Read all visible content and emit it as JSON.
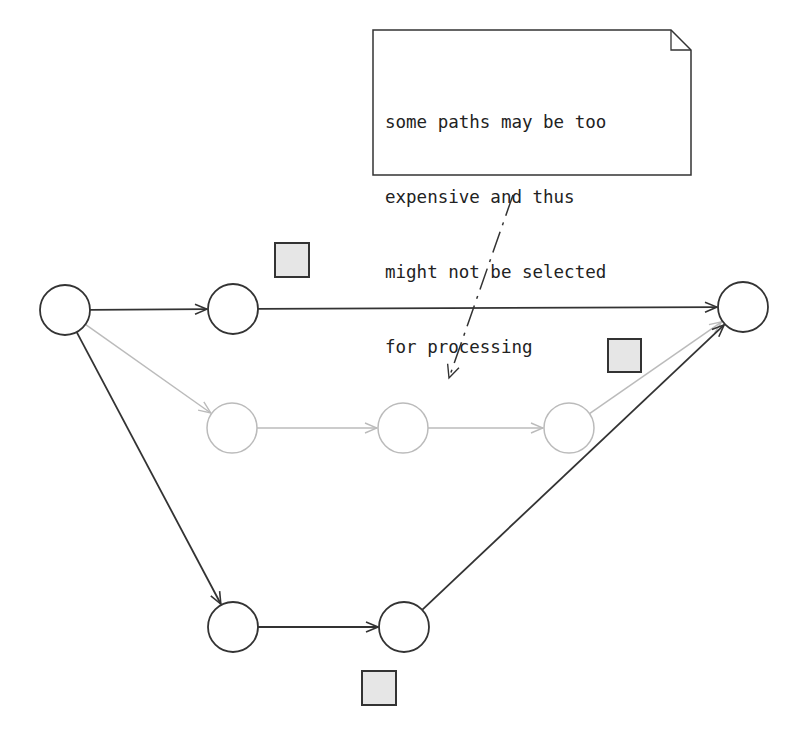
{
  "top_caption_partial": "",
  "note": {
    "lines": [
      "some paths may be too",
      "expensive and thus",
      "might not be selected",
      "for processing"
    ],
    "box": {
      "x": 373,
      "y": 30,
      "w": 318,
      "h": 145,
      "fold": 20
    }
  },
  "colors": {
    "active_stroke": "#333333",
    "inactive_stroke": "#bbbbbb",
    "square_fill": "#e6e6e6",
    "square_stroke": "#333333",
    "background": "#ffffff"
  },
  "nodes": [
    {
      "id": "A",
      "cx": 65,
      "cy": 310,
      "r": 25,
      "state": "active"
    },
    {
      "id": "B",
      "cx": 233,
      "cy": 309,
      "r": 25,
      "state": "active"
    },
    {
      "id": "C",
      "cx": 232,
      "cy": 428,
      "r": 25,
      "state": "inactive"
    },
    {
      "id": "D",
      "cx": 403,
      "cy": 428,
      "r": 25,
      "state": "inactive"
    },
    {
      "id": "E",
      "cx": 569,
      "cy": 428,
      "r": 25,
      "state": "inactive"
    },
    {
      "id": "F",
      "cx": 743,
      "cy": 307,
      "r": 25,
      "state": "active"
    },
    {
      "id": "G",
      "cx": 233,
      "cy": 627,
      "r": 25,
      "state": "active"
    },
    {
      "id": "H",
      "cx": 404,
      "cy": 627,
      "r": 25,
      "state": "active"
    }
  ],
  "edges": [
    {
      "from": "A",
      "to": "B",
      "state": "active"
    },
    {
      "from": "B",
      "to": "F",
      "state": "active"
    },
    {
      "from": "A",
      "to": "C",
      "state": "inactive"
    },
    {
      "from": "C",
      "to": "D",
      "state": "inactive"
    },
    {
      "from": "D",
      "to": "E",
      "state": "inactive"
    },
    {
      "from": "E",
      "to": "F",
      "state": "inactive"
    },
    {
      "from": "A",
      "to": "G",
      "state": "active"
    },
    {
      "from": "G",
      "to": "H",
      "state": "active"
    },
    {
      "from": "H",
      "to": "F",
      "state": "active"
    }
  ],
  "cost_squares": [
    {
      "x": 275,
      "y": 243,
      "size": 34,
      "near": "B-F path"
    },
    {
      "x": 608,
      "y": 339,
      "size": 33,
      "near": "E-F path"
    },
    {
      "x": 362,
      "y": 671,
      "size": 34,
      "near": "G-H path"
    }
  ],
  "annotation_arrow": {
    "style": "dash-dot",
    "x1": 513,
    "y1": 195,
    "x2": 449,
    "y2": 378
  }
}
